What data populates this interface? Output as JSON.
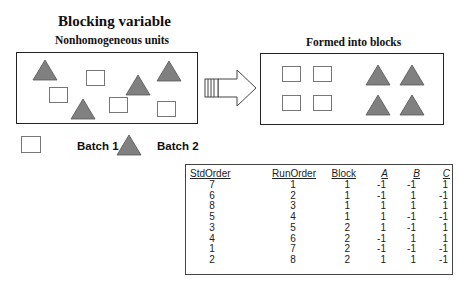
{
  "title": "Blocking variable",
  "left_panel": {
    "label": "Nonhomogeneous units"
  },
  "right_panel": {
    "label": "Formed into blocks"
  },
  "legend": {
    "batch1": "Batch 1",
    "batch2": "Batch 2"
  },
  "colors": {
    "triangle_fill": "#808080",
    "border": "#222222"
  },
  "table": {
    "headers": [
      "StdOrder",
      "RunOrder",
      "Block",
      "A",
      "B",
      "C"
    ],
    "rows": [
      [
        "7",
        "1",
        "1",
        "-1",
        "-1",
        "1"
      ],
      [
        "6",
        "2",
        "1",
        "-1",
        "1",
        "-1"
      ],
      [
        "8",
        "3",
        "1",
        "1",
        "1",
        "1"
      ],
      [
        "5",
        "4",
        "1",
        "1",
        "-1",
        "-1"
      ],
      [
        "3",
        "5",
        "2",
        "1",
        "-1",
        "1"
      ],
      [
        "4",
        "6",
        "2",
        "-1",
        "1",
        "1"
      ],
      [
        "1",
        "7",
        "2",
        "-1",
        "-1",
        "-1"
      ],
      [
        "2",
        "8",
        "2",
        "1",
        "1",
        "-1"
      ]
    ]
  }
}
